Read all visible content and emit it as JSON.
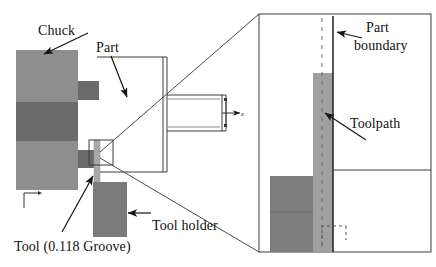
{
  "figure": {
    "type": "engineering-diagram"
  },
  "colors": {
    "chuck_body": "#8e8e8e",
    "chuck_band": "#6b6b6b",
    "chuck_step": "#6b6b6b",
    "tool_holder": "#7b7b7b",
    "tool": "#a8a8a8",
    "toolpath_band": "#a0a0a0",
    "detail_tool": "#7e7e7e",
    "outline": "#3c3c3c",
    "part_boundary": "#2a2a2a",
    "text": "#111111",
    "background": "#ffffff"
  },
  "labels": {
    "chuck": "Chuck",
    "part": "Part",
    "tool": "Tool (0.118 Groove)",
    "tool_holder": "Tool holder",
    "part_boundary_line1": "Part",
    "part_boundary_line2": "boundary",
    "toolpath": "Toolpath"
  },
  "annotations": {
    "groove_width": "0.118",
    "axis_indicator_main": "z",
    "axis_indicator_part": "z",
    "axis_indicator_detail": "z"
  },
  "views": {
    "main": {
      "name": "overall-setup-view",
      "components": [
        "chuck",
        "part",
        "tool",
        "tool-holder",
        "callout-box"
      ]
    },
    "detail": {
      "name": "magnified-detail-view",
      "components": [
        "part-boundary",
        "toolpath",
        "tool",
        "centerline"
      ]
    }
  },
  "icons": {
    "axis_marker": "axis-marker-icon",
    "leader_arrow": "leader-arrow-icon",
    "zoom_callout": "zoom-callout-icon"
  }
}
